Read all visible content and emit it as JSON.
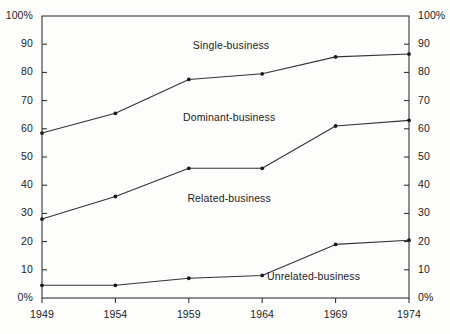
{
  "chart_data": {
    "type": "line",
    "title": "",
    "subtitle": "",
    "xlabel": "",
    "ylabel": "",
    "categories": [
      "1949",
      "1954",
      "1959",
      "1964",
      "1969",
      "1974"
    ],
    "x": [
      1949,
      1954,
      1959,
      1964,
      1969,
      1974
    ],
    "xlim": [
      1949,
      1974
    ],
    "ylim": [
      0,
      100
    ],
    "grid": false,
    "legend_position": "inline-band-labels",
    "y_axis_left_ticks": [
      "100%",
      "90",
      "80",
      "70",
      "60",
      "50",
      "40",
      "30",
      "20",
      "10",
      "0%"
    ],
    "y_axis_right_ticks": [
      "100%",
      "90",
      "80",
      "70",
      "60",
      "50",
      "40",
      "30",
      "20",
      "10",
      "0%"
    ],
    "y_tick_values": [
      100,
      90,
      80,
      70,
      60,
      50,
      40,
      30,
      20,
      10,
      0
    ],
    "series": [
      {
        "name": "Single-business upper boundary",
        "band_label": "Single-business",
        "values": [
          58.5,
          65.5,
          77.5,
          79.5,
          85.5,
          86.5
        ],
        "marker": "dot",
        "color": "#333333"
      },
      {
        "name": "Dominant-business upper boundary",
        "band_label": "Dominant-business",
        "values": [
          28,
          36,
          46,
          46,
          61,
          63
        ],
        "marker": "dot",
        "color": "#333333"
      },
      {
        "name": "Related-business upper boundary",
        "band_label": "Related-business",
        "values": [
          4.5,
          4.5,
          7,
          8,
          19,
          20.5
        ],
        "marker": "dot",
        "color": "#333333"
      }
    ],
    "band_labels": [
      {
        "text": "Single-business",
        "x_pct": 51.5,
        "y_pct": 89.5
      },
      {
        "text": "Dominant-business",
        "x_pct": 51.0,
        "y_pct": 64.0
      },
      {
        "text": "Related-business",
        "x_pct": 51.0,
        "y_pct": 35.0
      },
      {
        "text": "Unrelated-business",
        "x_pct": 74.0,
        "y_pct": 7.5
      }
    ],
    "colors": {
      "line": "#333333",
      "axis": "#222222",
      "marker": "#1a1a1a",
      "background": "#fdfdfc",
      "text": "#1c1c1c"
    }
  }
}
